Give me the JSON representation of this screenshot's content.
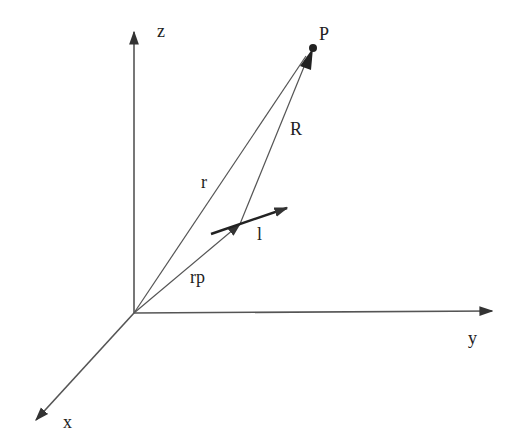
{
  "diagram": {
    "type": "3d-coordinate-vector-diagram",
    "colors": {
      "line": "#444444",
      "text": "#222222",
      "background": "#ffffff"
    },
    "axes": {
      "z": {
        "label": "z"
      },
      "y": {
        "label": "y"
      },
      "x": {
        "label": "x"
      }
    },
    "points": {
      "P": {
        "label": "P"
      }
    },
    "vectors": {
      "r": {
        "label": "r"
      },
      "R": {
        "label": "R"
      },
      "rp": {
        "label": "rp"
      },
      "l": {
        "label": "l"
      }
    }
  }
}
